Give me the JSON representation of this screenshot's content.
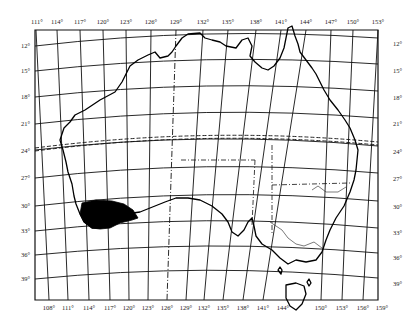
{
  "map": {
    "subject": "Australia",
    "projection_graticule": true,
    "colors": {
      "background": "#ffffff",
      "lines": "#111111",
      "highlight_fill": "#000000"
    },
    "top_longitude_labels": [
      "111°",
      "114°",
      "117°",
      "120°",
      "123°",
      "126°",
      "129°",
      "132°",
      "135°",
      "138°",
      "141°",
      "144°",
      "147°",
      "150°",
      "153°"
    ],
    "bottom_longitude_labels": [
      "108°",
      "111°",
      "114°",
      "117°",
      "120°",
      "123°",
      "126°",
      "129°",
      "132°",
      "135°",
      "138°",
      "141°",
      "144°",
      "150°",
      "153°",
      "156°",
      "159°"
    ],
    "left_latitude_labels": [
      "12°",
      "15°",
      "18°",
      "21°",
      "24°",
      "27°",
      "30°",
      "33°",
      "36°",
      "39°"
    ],
    "right_latitude_labels": [
      "12°",
      "15°",
      "18°",
      "21°",
      "24°",
      "27°",
      "30°",
      "33°",
      "36°",
      "39°"
    ],
    "features": {
      "highlighted_region": "South-west Western Australia (shaded black)",
      "tropic_line": "Tropic of Capricorn (dashed, ~23.5°S)",
      "state_borders": "dash-dot lines",
      "tasmania": "island south of mainland"
    }
  }
}
